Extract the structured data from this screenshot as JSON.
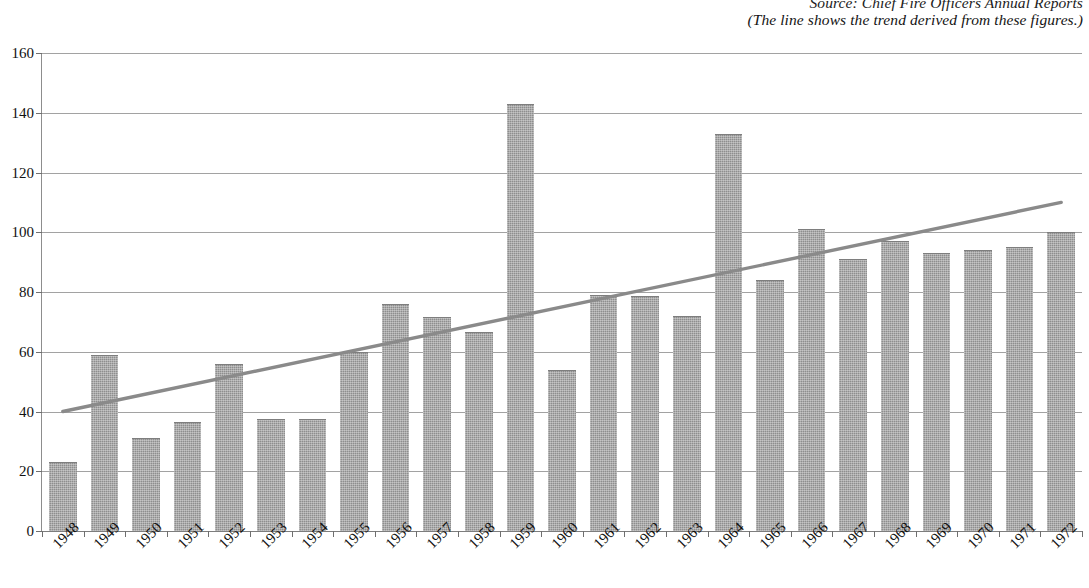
{
  "caption": {
    "source_line": "Source: Chief Fire Officers Annual Reports",
    "note_line": "(The line shows the trend derived from these figures.)"
  },
  "style": {
    "bar_color": "#8e8e8e",
    "bar_edge_color": "#7e7e7e",
    "grid_color": "#a2a2a2",
    "axis_color": "#7d7d7d",
    "trend_color": "#8a8a8a",
    "text_color": "#111111",
    "background": "#ffffff"
  },
  "chart_data": {
    "type": "bar",
    "title": "",
    "subtitle": "",
    "xlabel": "",
    "ylabel": "",
    "ylim": [
      0,
      160
    ],
    "ytick_step": 20,
    "yticks": [
      0,
      20,
      40,
      60,
      80,
      100,
      120,
      140,
      160
    ],
    "grid": true,
    "legend": false,
    "categories": [
      "1948",
      "1949",
      "1950",
      "1951",
      "1952",
      "1953",
      "1954",
      "1955",
      "1956",
      "1957",
      "1958",
      "1959",
      "1960",
      "1961",
      "1962",
      "1963",
      "1964",
      "1965",
      "1966",
      "1967",
      "1968",
      "1969",
      "1970",
      "1971",
      "1972"
    ],
    "values": [
      23,
      59,
      31,
      36.5,
      56,
      37.5,
      37.5,
      60,
      76,
      71.5,
      66.5,
      143,
      54,
      79,
      78.5,
      72,
      133,
      84,
      101,
      91,
      97,
      93,
      94,
      95,
      100
    ],
    "series": [
      {
        "name": "Annual figures",
        "type": "bar",
        "values": [
          23,
          59,
          31,
          36.5,
          56,
          37.5,
          37.5,
          60,
          76,
          71.5,
          66.5,
          143,
          54,
          79,
          78.5,
          72,
          133,
          84,
          101,
          91,
          97,
          93,
          94,
          95,
          100
        ]
      },
      {
        "name": "Trend line",
        "type": "line",
        "endpoints": [
          {
            "category": "1948",
            "value": 40
          },
          {
            "category": "1972",
            "value": 110
          }
        ]
      }
    ],
    "annotations": [
      "Source: Chief Fire Officers Annual Reports",
      "(The line shows the trend derived from these figures.)"
    ]
  }
}
